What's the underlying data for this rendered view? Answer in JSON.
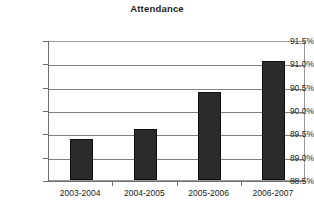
{
  "chart_data": {
    "type": "bar",
    "title": "Attendance",
    "xlabel": "",
    "ylabel": "",
    "categories": [
      "2003-2004",
      "2004-2005",
      "2005-2006",
      "2006-2007"
    ],
    "values": [
      89.37,
      89.6,
      90.39,
      91.06
    ],
    "value_labels": [
      "89.37%",
      "89.60%",
      "90.39%",
      "91.06%"
    ],
    "ylim": [
      88.5,
      91.5
    ],
    "ytick_values": [
      88.5,
      89.0,
      89.5,
      90.0,
      90.5,
      91.0,
      91.5
    ],
    "ytick_labels": [
      "88.5%",
      "89.0%",
      "89.5%",
      "90.0%",
      "90.5%",
      "91.0%",
      "91.5%"
    ],
    "grid": true,
    "grid_axis": "y",
    "legend": false,
    "bar_color": "#2b2b2b",
    "bar_border_color": "#0e0e0e",
    "gridline_color": "#808080",
    "axis_color": "#6e6e6e",
    "plot_border_color": "#9a9a9a",
    "text_color": "#1c1c1c",
    "background_color": "#ffffff"
  }
}
